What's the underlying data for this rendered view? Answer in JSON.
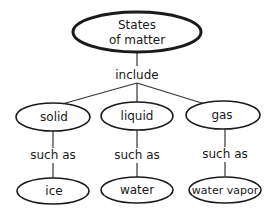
{
  "diagram": {
    "type": "concept-map",
    "root": {
      "line1": "States",
      "line2": "of matter"
    },
    "root_link": "include",
    "states": [
      {
        "label": "solid",
        "link": "such as",
        "example": "ice"
      },
      {
        "label": "liquid",
        "link": "such as",
        "example": "water"
      },
      {
        "label": "gas",
        "link": "such as",
        "example": "water vapor"
      }
    ]
  }
}
